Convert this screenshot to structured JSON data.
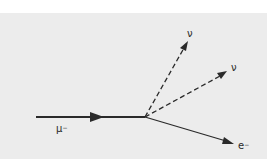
{
  "diagram": {
    "colors": {
      "background": "#ececec",
      "top_band": "#ffffff",
      "ink": "#2a2a2a"
    },
    "particles": {
      "incoming": {
        "label": "μ",
        "charge": "−",
        "style": "solid"
      },
      "neutrino_1": {
        "label": "ν",
        "style": "dashed"
      },
      "neutrino_2": {
        "label": "ν",
        "style": "dashed"
      },
      "electron": {
        "label": "e",
        "charge": "−",
        "style": "solid"
      }
    }
  }
}
